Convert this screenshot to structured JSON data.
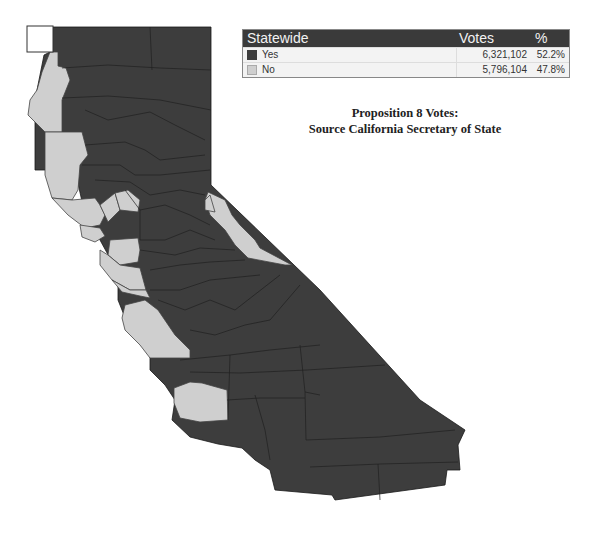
{
  "legend": {
    "header": {
      "region": "Statewide",
      "votes": "Votes",
      "percent": "%"
    },
    "rows": [
      {
        "label": "Yes",
        "votes": "6,321,102",
        "percent": "52.2%",
        "swatch": "yes-swatch",
        "color": "#3d3d3d"
      },
      {
        "label": "No",
        "votes": "5,796,104",
        "percent": "47.8%",
        "swatch": "no-swatch",
        "color": "#cfcfcf"
      }
    ]
  },
  "caption": {
    "line1": "Proposition 8 Votes:",
    "line2": "Source California Secretary of State"
  },
  "map": {
    "title": "California counties, Proposition 8 result by county",
    "colors": {
      "yes": "#3d3d3d",
      "no": "#cfcfcf"
    }
  }
}
